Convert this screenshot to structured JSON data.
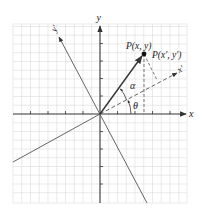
{
  "diagram": {
    "axes": {
      "x_label": "x",
      "y_label": "y",
      "x_prime_label": "x′",
      "y_prime_label": "y′"
    },
    "point": {
      "label_original": "P(x, y)",
      "label_rotated": "P(x′, y′)"
    },
    "angles": {
      "alpha_label": "α",
      "theta_label": "θ"
    },
    "grid": {
      "minor_spacing_px": 8.75,
      "tick_every_cells": 2
    },
    "colors": {
      "grid": "#d9d9d9",
      "axis": "#333333",
      "rotated_axis": "#555555",
      "vector": "#333333"
    }
  }
}
